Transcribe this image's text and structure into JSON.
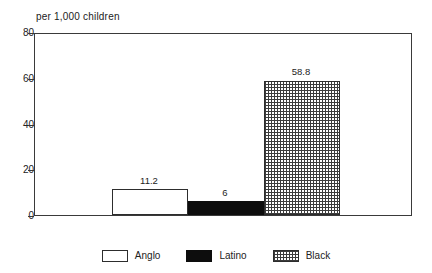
{
  "chart_data": {
    "type": "bar",
    "title": "per 1,000 children",
    "subtitle": "",
    "xlabel": "",
    "ylabel": "",
    "ylim": [
      0,
      80
    ],
    "yticks": [
      0,
      20,
      40,
      60,
      80
    ],
    "ytick_labels": [
      "0",
      "20",
      "40",
      "60",
      "80"
    ],
    "grid": false,
    "legend_position": "bottom",
    "categories": [
      "Anglo",
      "Latino",
      "Black"
    ],
    "values": [
      11.2,
      6,
      58.8
    ],
    "value_labels": [
      "11.2",
      "6",
      "58.8"
    ],
    "series": [
      {
        "name": "per 1,000 children",
        "values": [
          11.2,
          6,
          58.8
        ]
      }
    ],
    "bars": [
      {
        "category": "Anglo",
        "value": 11.2,
        "label": "11.2",
        "fill": "white",
        "fill_class": "fill-white"
      },
      {
        "category": "Latino",
        "value": 6,
        "label": "6",
        "fill": "black",
        "fill_class": "fill-black"
      },
      {
        "category": "Black",
        "value": 58.8,
        "label": "58.8",
        "fill": "cross-hatch",
        "fill_class": "fill-hatch"
      }
    ],
    "legend": [
      {
        "label": "Anglo",
        "fill": "white",
        "fill_class": "fill-white"
      },
      {
        "label": "Latino",
        "fill": "black",
        "fill_class": "fill-black"
      },
      {
        "label": "Black",
        "fill": "cross-hatch",
        "fill_class": "fill-hatch"
      }
    ],
    "colors": {
      "axis": "#3a3a3a",
      "text": "#222222",
      "bar_anglo": "#ffffff",
      "bar_latino": "#0d0d0d",
      "bar_black_hatch": "#3c3c3c",
      "background": "#ffffff"
    }
  }
}
